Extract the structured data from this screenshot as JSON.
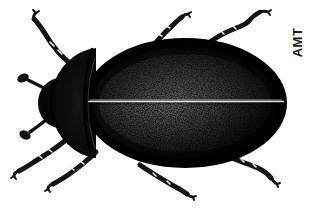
{
  "figure": {
    "subject_common_name": "Beetle",
    "view": "dorsal",
    "medium": "stipple ink drawing",
    "background_color": "#fefefe",
    "ink_color": "#111111",
    "width_px": 317,
    "height_px": 210
  },
  "signature": {
    "text": "AMT",
    "rotation_deg": -90,
    "color": "#1a1a1a",
    "position": "upper-right"
  },
  "anatomy": {
    "head": {
      "label": "head",
      "fill": "#0d0d0d"
    },
    "pronotum": {
      "label": "pronotum",
      "fill": "#111111"
    },
    "elytra": {
      "label": "elytra",
      "fill": "#1c1c1c",
      "texture": "stipple",
      "suture_line_color": "#d8d8d8"
    },
    "suture": {
      "label": "elytral-suture"
    },
    "antennae": [
      {
        "label": "left-antenna-upper",
        "club_tip": true
      },
      {
        "label": "left-antenna-lower",
        "club_tip": true
      }
    ],
    "legs": [
      {
        "label": "front-left-leg",
        "direction": "upper-left"
      },
      {
        "label": "mid-left-leg",
        "direction": "lower-left"
      },
      {
        "label": "hind-left-leg",
        "direction": "lower-left"
      },
      {
        "label": "front-right-leg",
        "direction": "upper-right"
      },
      {
        "label": "mid-right-leg",
        "direction": "upper-right"
      },
      {
        "label": "hind-right-leg",
        "direction": "lower-right"
      },
      {
        "label": "mid-lower-leg",
        "direction": "lower-center"
      }
    ]
  }
}
